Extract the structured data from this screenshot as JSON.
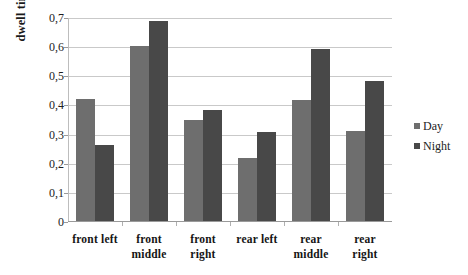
{
  "chart_data": {
    "type": "bar",
    "title": "",
    "subtitle": "",
    "xlabel": "",
    "ylabel": "dwell time [s]",
    "ylim": [
      0,
      0.7
    ],
    "ytick_values": [
      0.7,
      0.6,
      0.5,
      0.4,
      0.3,
      0.2,
      0.1,
      0
    ],
    "ytick_labels": [
      "0,7",
      "0,6",
      "0,5",
      "0,4",
      "0,3",
      "0,2",
      "0,1",
      "0"
    ],
    "decimal_separator": ",",
    "grid": "horizontal",
    "legend_position": "right",
    "categories": [
      "front left",
      "front middle",
      "front right",
      "rear left",
      "rear middle",
      "rear right"
    ],
    "category_lines": [
      [
        "front left"
      ],
      [
        "front",
        "middle"
      ],
      [
        "front",
        "right"
      ],
      [
        "rear left"
      ],
      [
        "rear",
        "middle"
      ],
      [
        "rear",
        "right"
      ]
    ],
    "series": [
      {
        "name": "Day",
        "color": "#6e6e6e",
        "values": [
          0.42,
          0.6,
          0.345,
          0.215,
          0.415,
          0.31
        ]
      },
      {
        "name": "Night",
        "color": "#484848",
        "values": [
          0.26,
          0.685,
          0.38,
          0.305,
          0.59,
          0.48
        ]
      }
    ]
  },
  "legend": {
    "items": [
      {
        "label": "Day",
        "marker": "square-marker-day"
      },
      {
        "label": "Night",
        "marker": "square-marker-night"
      }
    ]
  },
  "axes": {
    "y_title": "dwell time [s]"
  }
}
